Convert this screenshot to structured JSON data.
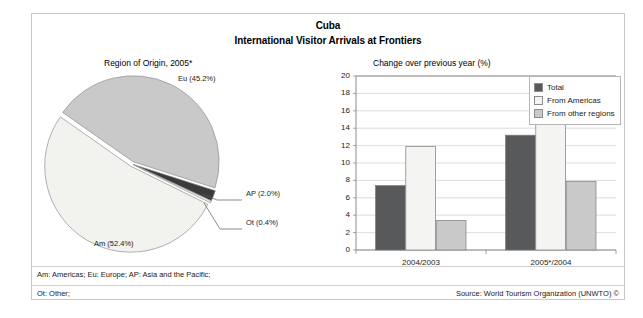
{
  "figure": {
    "title": "Cuba",
    "subtitle": "International Visitor Arrivals at Frontiers",
    "pie_panel_title": "Region of Origin, 2005*",
    "bar_panel_title": "Change over previous year (%)",
    "footnote_1": "Am: Americas; Eu: Europe; AP: Asia and the Pacific;",
    "footnote_2": "Ot: Other;",
    "source": "Source: World Tourism Organization (UNWTO) ©"
  },
  "colors": {
    "total": "#58595b",
    "from_americas": "#f4f4f2",
    "from_other_regions": "#c9c9c9",
    "pie_am": "#f2f2ef",
    "pie_eu": "#c9c9c9",
    "pie_ap": "#3a3a3a",
    "pie_ot": "#efefef",
    "axis": "#8c8c8c",
    "grid": "#d4d4d4",
    "frame": "#c9c9c9"
  },
  "chart_data": [
    {
      "type": "pie",
      "title": "Region of Origin, 2005*",
      "legend_position": "callout-labels",
      "categories": [
        "Eu",
        "Am",
        "AP",
        "Ot"
      ],
      "values": [
        45.2,
        52.4,
        2.0,
        0.4
      ],
      "slices": [
        {
          "key": "eu",
          "code": "Eu",
          "name": "Europe",
          "value": 45.2,
          "label": "Eu (45.2%)",
          "color": "#c9c9c9"
        },
        {
          "key": "am",
          "code": "Am",
          "name": "Americas",
          "value": 52.4,
          "label": "Am (52.4%)",
          "color": "#f2f2ef"
        },
        {
          "key": "ap",
          "code": "AP",
          "name": "Asia and the Pacific",
          "value": 2.0,
          "label": "AP (2.0%)",
          "color": "#3a3a3a"
        },
        {
          "key": "ot",
          "code": "Ot",
          "name": "Other",
          "value": 0.4,
          "label": "Ot (0.4%)",
          "color": "#efefef"
        }
      ],
      "units": "%"
    },
    {
      "type": "bar",
      "title": "Change over previous year (%)",
      "categories": [
        "2004/2003",
        "2005*/2004"
      ],
      "series": [
        {
          "name": "Total",
          "values": [
            7.4,
            13.2
          ],
          "color": "#58595b"
        },
        {
          "name": "From Americas",
          "values": [
            11.9,
            18.5
          ],
          "color": "#f4f4f2"
        },
        {
          "name": "From other regions",
          "values": [
            3.4,
            7.9
          ],
          "color": "#c9c9c9"
        }
      ],
      "xlabel": "",
      "ylabel": "",
      "ylim": [
        0,
        20
      ],
      "ytick_step": 2,
      "yticks": [
        20,
        18,
        16,
        14,
        12,
        10,
        8,
        6,
        4,
        2,
        0
      ],
      "grid": true,
      "legend_position": "top-right"
    }
  ]
}
